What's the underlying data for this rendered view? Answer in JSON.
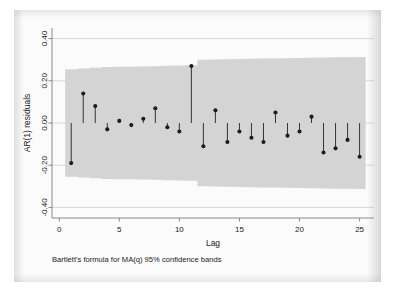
{
  "figure": {
    "caption": "Bartlett's formula for MA(q) 95% confidence bands",
    "background_color": "#fbfbfb",
    "band_color": "#d4d4d4",
    "marker_color": "#1c1c1c"
  },
  "chart_data": {
    "type": "scatter",
    "title": "",
    "subtitle": "",
    "xlabel": "Lag",
    "ylabel": "AR(1) residuals",
    "annotation": "Bartlett's formula for MA(q) 95% confidence bands",
    "xlim": [
      -0.6,
      26.2
    ],
    "ylim": [
      -0.45,
      0.45
    ],
    "xticks": [
      0,
      5,
      10,
      15,
      20,
      25
    ],
    "xticklabels": [
      "0",
      "5",
      "10",
      "15",
      "20",
      "25"
    ],
    "yticks": [
      0.4,
      0.2,
      0.0,
      -0.2,
      -0.4
    ],
    "yticklabels": [
      "0.40",
      "0.20",
      "0.00",
      "-0.20",
      "-0.40"
    ],
    "grid": true,
    "grid_axis": "y",
    "legend": "none",
    "marker_style": "stem-with-dot",
    "baseline": 0.0,
    "x": [
      1,
      2,
      3,
      4,
      5,
      6,
      7,
      8,
      9,
      10,
      11,
      12,
      13,
      14,
      15,
      16,
      17,
      18,
      19,
      20,
      21,
      22,
      23,
      24,
      25
    ],
    "values": [
      -0.19,
      0.14,
      0.08,
      -0.03,
      0.01,
      -0.01,
      0.02,
      0.07,
      -0.02,
      -0.04,
      0.27,
      -0.11,
      0.06,
      -0.09,
      -0.04,
      -0.07,
      -0.09,
      0.05,
      -0.06,
      -0.04,
      0.03,
      -0.14,
      -0.12,
      -0.08,
      -0.16
    ],
    "confidence_band": {
      "label": "Bartlett's formula for MA(q) 95% confidence bands",
      "upper": [
        0.255,
        0.258,
        0.262,
        0.265,
        0.266,
        0.267,
        0.268,
        0.269,
        0.271,
        0.272,
        0.273,
        0.3,
        0.301,
        0.302,
        0.303,
        0.304,
        0.305,
        0.306,
        0.307,
        0.308,
        0.309,
        0.31,
        0.311,
        0.312,
        0.313
      ],
      "lower": [
        -0.255,
        -0.258,
        -0.262,
        -0.265,
        -0.266,
        -0.267,
        -0.268,
        -0.269,
        -0.271,
        -0.272,
        -0.273,
        -0.3,
        -0.301,
        -0.302,
        -0.303,
        -0.304,
        -0.305,
        -0.306,
        -0.307,
        -0.308,
        -0.309,
        -0.31,
        -0.311,
        -0.312,
        -0.313
      ]
    }
  }
}
